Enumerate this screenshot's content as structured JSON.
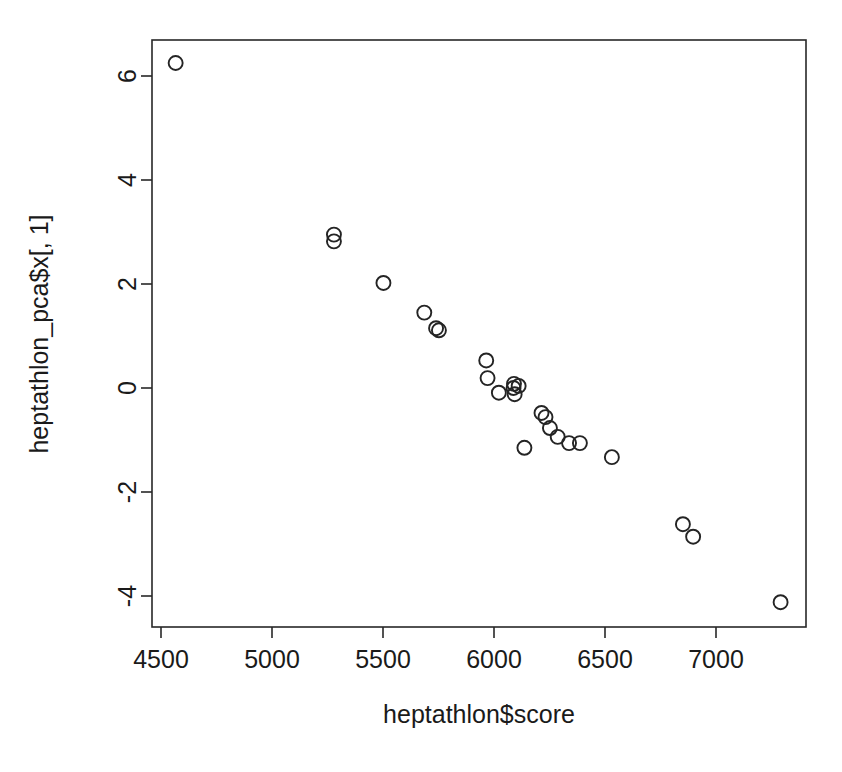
{
  "chart_data": {
    "type": "scatter",
    "title": "",
    "subtitle": "",
    "xlabel": "heptathlon$score",
    "ylabel": "heptathlon_pca$x[, 1]",
    "xlim": [
      4450,
      7400
    ],
    "ylim": [
      -4.6,
      6.6
    ],
    "xticks": [
      4500,
      5000,
      5500,
      6000,
      6500,
      7000
    ],
    "yticks": [
      6,
      4,
      2,
      0,
      -2,
      -4
    ],
    "xtick_labels": [
      "4500",
      "5000",
      "5500",
      "6000",
      "6500",
      "7000"
    ],
    "ytick_labels": [
      "6",
      "4",
      "2",
      "0",
      "-2",
      "-4"
    ],
    "grid": false,
    "legend": false,
    "legend_position": "none",
    "marker": "open-circle",
    "marker_radius": 7,
    "point_color": "#242424",
    "axis_color": "#272727",
    "background_color": "#ffffff",
    "n_points": 25,
    "x": [
      4566,
      5279,
      5279,
      5502,
      5686,
      5739,
      5752,
      5965,
      5971,
      6022,
      6088,
      6090,
      6093,
      6111,
      6137,
      6214,
      6232,
      6252,
      6287,
      6338,
      6387,
      6531,
      6851,
      6897,
      7291
    ],
    "y": [
      6.25,
      2.95,
      2.82,
      2.02,
      1.45,
      1.15,
      1.11,
      0.53,
      0.19,
      -0.09,
      0.0,
      0.08,
      -0.12,
      0.04,
      -1.15,
      -0.48,
      -0.56,
      -0.77,
      -0.94,
      -1.06,
      -1.06,
      -1.33,
      -2.62,
      -2.86,
      -4.12
    ],
    "points": [
      {
        "x": 4566,
        "y": 6.25
      },
      {
        "x": 5279,
        "y": 2.95
      },
      {
        "x": 5279,
        "y": 2.82
      },
      {
        "x": 5502,
        "y": 2.02
      },
      {
        "x": 5686,
        "y": 1.45
      },
      {
        "x": 5739,
        "y": 1.15
      },
      {
        "x": 5752,
        "y": 1.11
      },
      {
        "x": 5965,
        "y": 0.53
      },
      {
        "x": 5971,
        "y": 0.19
      },
      {
        "x": 6022,
        "y": -0.09
      },
      {
        "x": 6088,
        "y": 0.0
      },
      {
        "x": 6090,
        "y": 0.08
      },
      {
        "x": 6093,
        "y": -0.12
      },
      {
        "x": 6111,
        "y": 0.04
      },
      {
        "x": 6137,
        "y": -1.15
      },
      {
        "x": 6214,
        "y": -0.48
      },
      {
        "x": 6232,
        "y": -0.56
      },
      {
        "x": 6252,
        "y": -0.77
      },
      {
        "x": 6287,
        "y": -0.94
      },
      {
        "x": 6338,
        "y": -1.06
      },
      {
        "x": 6387,
        "y": -1.06
      },
      {
        "x": 6531,
        "y": -1.33
      },
      {
        "x": 6851,
        "y": -2.62
      },
      {
        "x": 6897,
        "y": -2.86
      },
      {
        "x": 7291,
        "y": -4.12
      }
    ]
  },
  "plot_geometry": {
    "frame_left": 152,
    "frame_right": 806,
    "frame_top": 40,
    "frame_bottom": 627,
    "x_pixel_at_4500": 161,
    "x_pixels_per_unit": 0.222,
    "y_pixel_at_zero": 388,
    "y_pixels_per_unit": 52,
    "tick_length": 11,
    "xlabel_y": 723,
    "ylabel_x": 48
  }
}
